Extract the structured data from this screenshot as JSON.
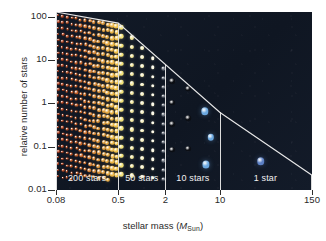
{
  "figure": {
    "background_color": "#ffffff",
    "plot_background_color": "#121a27",
    "line_color": "#e8e8e8",
    "tick_color": "#2d2d2d",
    "text_color": "#2a2a2a",
    "caption_color": "#f2f2f2"
  },
  "chart_data": {
    "type": "scatter",
    "title": "",
    "subtitle": "",
    "xlabel": "stellar mass (M_Sun)",
    "xlabel_parts": {
      "prefix": "stellar mass (",
      "symbol": "M",
      "subscript": "Sun",
      "suffix": ")"
    },
    "ylabel": "relative number of stars",
    "xscale": "log",
    "yscale": "log",
    "xlim": [
      0.08,
      150
    ],
    "ylim": [
      0.01,
      130
    ],
    "grid": false,
    "legend": "none",
    "xticks": [
      0.08,
      0.5,
      2,
      10,
      150
    ],
    "xticklabels": [
      "0.08",
      "0.5",
      "2",
      "10",
      "150"
    ],
    "yticks": [
      100,
      10,
      1,
      0.1,
      0.01
    ],
    "yticklabels": [
      "100",
      "10",
      "1",
      "0.1",
      "0.01"
    ],
    "imf_curve": {
      "name": "initial mass function upper envelope",
      "color": "#e8e8e8",
      "points": [
        {
          "x": 0.08,
          "y": 130
        },
        {
          "x": 0.5,
          "y": 72
        },
        {
          "x": 10,
          "y": 0.62
        },
        {
          "x": 150,
          "y": 0.022
        }
      ]
    },
    "mass_bins": [
      {
        "label": "200 stars",
        "count": 200,
        "x_range": [
          0.08,
          0.5
        ],
        "color_range": [
          "#b03a16",
          "#f0c24a"
        ],
        "star_type": "low-mass red/orange dwarfs"
      },
      {
        "label": "50 stars",
        "count": 50,
        "x_range": [
          0.5,
          2
        ],
        "color_range": [
          "#f2e27a",
          "#ffffff"
        ],
        "star_type": "sun-like yellow/white stars"
      },
      {
        "label": "10 stars",
        "count": 10,
        "x_range": [
          2,
          10
        ],
        "color_range": [
          "#0c0f15",
          "#7fb4e8"
        ],
        "star_type": "intermediate to blue stars"
      },
      {
        "label": "1 star",
        "count": 1,
        "x_range": [
          10,
          150
        ],
        "color_range": [
          "#4a6fb5",
          "#4a6fb5"
        ],
        "star_type": "massive blue star"
      }
    ],
    "annotations": [
      {
        "text": "200 stars",
        "x": 0.2,
        "y": 0.018
      },
      {
        "text": "50 stars",
        "x": 1.0,
        "y": 0.018
      },
      {
        "text": "10 stars",
        "x": 4.5,
        "y": 0.018
      },
      {
        "text": "1 star",
        "x": 38.0,
        "y": 0.018
      }
    ]
  }
}
